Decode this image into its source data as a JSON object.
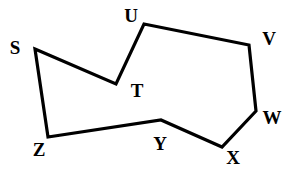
{
  "figure": {
    "background_color": "#ffffff",
    "stroke_color": "#000000",
    "label_color": "#000000",
    "stroke_width": 3.2,
    "width": 296,
    "height": 171
  },
  "chart_data": {
    "type": "diagram",
    "subtype": "polygon",
    "title": "",
    "closed": true,
    "vertex_order": [
      "S",
      "T",
      "U",
      "V",
      "W",
      "X",
      "Y",
      "Z"
    ],
    "vertices": [
      {
        "id": "S",
        "label": "S",
        "x": 35,
        "y": 49,
        "label_x": 15,
        "label_y": 47
      },
      {
        "id": "T",
        "label": "T",
        "x": 116,
        "y": 84,
        "label_x": 137,
        "label_y": 90
      },
      {
        "id": "U",
        "label": "U",
        "x": 144,
        "y": 24,
        "label_x": 131,
        "label_y": 15
      },
      {
        "id": "V",
        "label": "V",
        "x": 249,
        "y": 45,
        "label_x": 269,
        "label_y": 38
      },
      {
        "id": "W",
        "label": "W",
        "x": 256,
        "y": 111,
        "label_x": 272,
        "label_y": 117
      },
      {
        "id": "X",
        "label": "X",
        "x": 222,
        "y": 147,
        "label_x": 233,
        "label_y": 157
      },
      {
        "id": "Y",
        "label": "Y",
        "x": 161,
        "y": 120,
        "label_x": 160,
        "label_y": 143
      },
      {
        "id": "Z",
        "label": "Z",
        "x": 48,
        "y": 137,
        "label_x": 39,
        "label_y": 149
      }
    ],
    "edges": [
      {
        "from": "S",
        "to": "T"
      },
      {
        "from": "T",
        "to": "U"
      },
      {
        "from": "U",
        "to": "V"
      },
      {
        "from": "V",
        "to": "W"
      },
      {
        "from": "W",
        "to": "X"
      },
      {
        "from": "X",
        "to": "Y"
      },
      {
        "from": "Y",
        "to": "Z"
      },
      {
        "from": "Z",
        "to": "S"
      }
    ]
  }
}
